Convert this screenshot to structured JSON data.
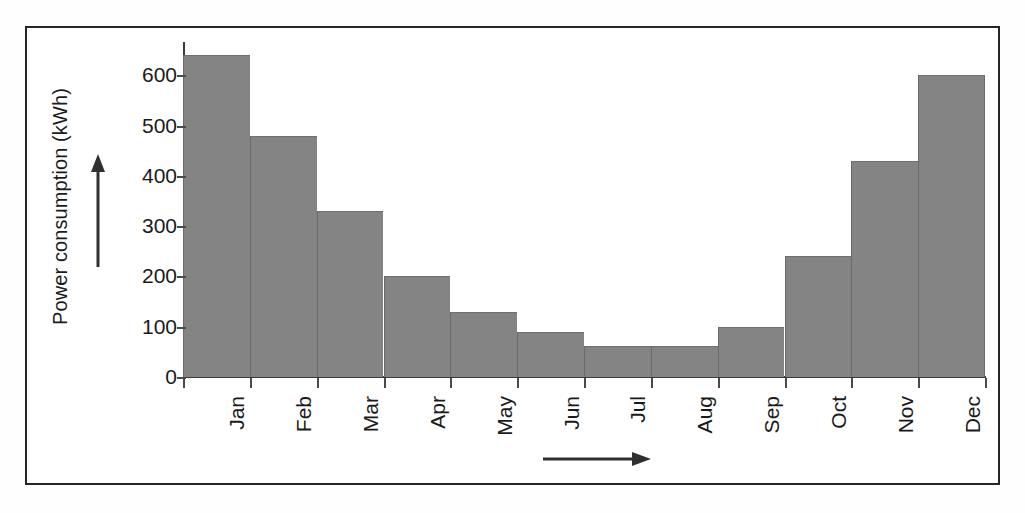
{
  "figure": {
    "background_color": "#ffffff",
    "frame_color": "#252525",
    "bar_color": "#848484",
    "axis_color": "#3a3a3a",
    "text_color": "#1a1a1a"
  },
  "axis": {
    "y_label": "Power consumption (kWh)",
    "y_ticks": [
      "0",
      "100",
      "200",
      "300",
      "400",
      "500",
      "600"
    ],
    "y_arrow_icon": "up-arrow-icon",
    "x_arrow_icon": "right-arrow-icon"
  },
  "chart_data": {
    "type": "bar",
    "title": "",
    "xlabel": "",
    "ylabel": "Power consumption (kWh)",
    "categories": [
      "Jan",
      "Feb",
      "Mar",
      "Apr",
      "May",
      "Jun",
      "Jul",
      "Aug",
      "Sep",
      "Oct",
      "Nov",
      "Dec"
    ],
    "values": [
      640,
      480,
      330,
      200,
      130,
      90,
      62,
      62,
      100,
      240,
      430,
      600
    ],
    "ylim": [
      0,
      670
    ],
    "ytick_values": [
      0,
      100,
      200,
      300,
      400,
      500,
      600
    ],
    "grid": false,
    "legend": null
  }
}
